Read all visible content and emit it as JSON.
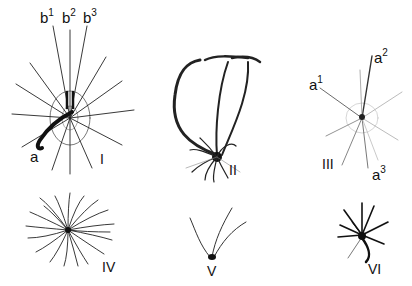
{
  "figure": {
    "panels": [
      {
        "id": "I",
        "roman_label": "I",
        "annotations": [
          {
            "base": "b",
            "sup": "1"
          },
          {
            "base": "b",
            "sup": "2"
          },
          {
            "base": "b",
            "sup": "3"
          },
          {
            "base": "a",
            "sup": ""
          }
        ]
      },
      {
        "id": "II",
        "roman_label": "II",
        "annotations": []
      },
      {
        "id": "III",
        "roman_label": "III",
        "annotations": [
          {
            "base": "a",
            "sup": "1"
          },
          {
            "base": "a",
            "sup": "2"
          },
          {
            "base": "a",
            "sup": "3"
          }
        ]
      },
      {
        "id": "IV",
        "roman_label": "IV",
        "annotations": []
      },
      {
        "id": "V",
        "roman_label": "V",
        "annotations": []
      },
      {
        "id": "VI",
        "roman_label": "VI",
        "annotations": []
      }
    ],
    "colors": {
      "ink": "#111111",
      "background": "#ffffff",
      "faint": "#9a9a9a"
    }
  }
}
